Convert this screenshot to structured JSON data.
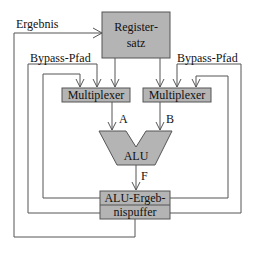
{
  "diagram": {
    "labels": {
      "ergebnis": "Ergebnis",
      "bypass_left": "Bypass-Pfad",
      "bypass_right": "Bypass-Pfad",
      "a": "A",
      "b": "B",
      "f": "F"
    },
    "blocks": {
      "registersatz_line1": "Register-",
      "registersatz_line2": "satz",
      "mux_left": "Multiplexer",
      "mux_right": "Multiplexer",
      "alu": "ALU",
      "buffer_line1": "ALU-Ergeb-",
      "buffer_line2": "nispuffer"
    },
    "colors": {
      "block_fill": "#b4b4b4",
      "line": "#555555",
      "text": "#111111"
    }
  }
}
